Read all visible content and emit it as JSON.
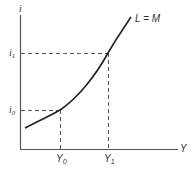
{
  "diagram": {
    "type": "economics-curve",
    "axes": {
      "y_label": "i",
      "x_label": "Y"
    },
    "curve": {
      "label": "L = M"
    },
    "reference_points": [
      {
        "x_label": "Y",
        "x_sub": "0",
        "y_label": "i",
        "y_sub": "0"
      },
      {
        "x_label": "Y",
        "x_sub": "1",
        "y_label": "i",
        "y_sub": "1"
      }
    ],
    "colors": {
      "line": "#333333",
      "dashed": "#555555",
      "background": "#ffffff"
    }
  }
}
